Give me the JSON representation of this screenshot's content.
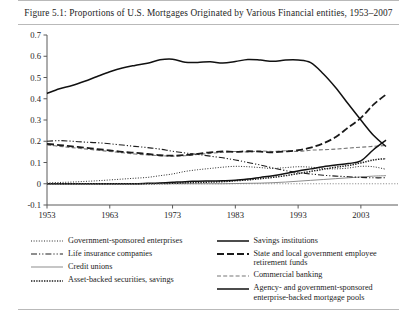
{
  "figure": {
    "caption": "Figure 5.1: Proportions of U.S. Mortgages Originated by Various Financial entities, 1953–2007"
  },
  "legend": {
    "left": [
      {
        "label": "Government-sponsored enterprises",
        "style": "dotted-fine"
      },
      {
        "label": "Life insurance companies",
        "style": "dash-dot-dot"
      },
      {
        "label": "Credit unions",
        "style": "solid-light"
      },
      {
        "label": "Asset-backed securities, savings",
        "style": "dotted-heavy"
      }
    ],
    "right": [
      {
        "label": "Savings institutions",
        "style": "solid-dark"
      },
      {
        "label": "State and local government employee retirement funds",
        "style": "dash-long"
      },
      {
        "label": "Commercial banking",
        "style": "dashed-light"
      },
      {
        "label": "Agency- and government-sponsored enterprise-backed mortgage pools",
        "style": "solid-dark"
      }
    ]
  },
  "chart_data": {
    "type": "line",
    "title": "Figure 5.1: Proportions of U.S. Mortgages Originated by Various Financial entities, 1953–2007",
    "xlabel": "",
    "ylabel": "",
    "xlim": [
      1953,
      2007
    ],
    "ylim": [
      -0.1,
      0.7
    ],
    "xticks": [
      1953,
      1963,
      1973,
      1983,
      1993,
      2003
    ],
    "yticks": [
      -0.1,
      0,
      0.1,
      0.2,
      0.3,
      0.4,
      0.5,
      0.6,
      0.7
    ],
    "ytick_labels": [
      "-0.1",
      "0",
      "0.1",
      "0.2",
      "0.3",
      "0.4",
      "0.5",
      "0.6",
      "0.7"
    ],
    "grid": false,
    "legend_position": "below",
    "x": [
      1953,
      1955,
      1957,
      1959,
      1961,
      1963,
      1965,
      1967,
      1969,
      1971,
      1973,
      1975,
      1977,
      1979,
      1981,
      1983,
      1985,
      1987,
      1989,
      1991,
      1993,
      1995,
      1997,
      1999,
      2001,
      2003,
      2005,
      2007
    ],
    "series": [
      {
        "name": "Savings institutions",
        "style": "solid-dark",
        "values": [
          0.425,
          0.447,
          0.462,
          0.482,
          0.505,
          0.527,
          0.545,
          0.557,
          0.567,
          0.583,
          0.586,
          0.572,
          0.571,
          0.574,
          0.568,
          0.575,
          0.585,
          0.582,
          0.576,
          0.582,
          0.582,
          0.57,
          0.518,
          0.452,
          0.375,
          0.3,
          0.228,
          0.175
        ]
      },
      {
        "name": "Agency- and government-sponsored enterprise-backed mortgage pools",
        "style": "solid-dark-rising",
        "values": [
          0.0,
          0.0,
          0.0,
          0.0,
          0.0,
          0.0,
          0.0,
          0.0,
          0.002,
          0.004,
          0.007,
          0.01,
          0.012,
          0.013,
          0.014,
          0.016,
          0.022,
          0.03,
          0.038,
          0.048,
          0.06,
          0.07,
          0.08,
          0.088,
          0.095,
          0.108,
          0.16,
          0.205
        ]
      },
      {
        "name": "State and local government employee retirement funds",
        "style": "dash-long",
        "values": [
          0.188,
          0.182,
          0.176,
          0.17,
          0.163,
          0.157,
          0.15,
          0.146,
          0.14,
          0.134,
          0.132,
          0.135,
          0.141,
          0.148,
          0.152,
          0.15,
          0.153,
          0.151,
          0.148,
          0.152,
          0.158,
          0.17,
          0.19,
          0.22,
          0.265,
          0.31,
          0.372,
          0.42
        ]
      },
      {
        "name": "Life insurance companies",
        "style": "dash-dot-dot",
        "values": [
          0.2,
          0.203,
          0.2,
          0.196,
          0.193,
          0.188,
          0.182,
          0.176,
          0.17,
          0.163,
          0.153,
          0.145,
          0.138,
          0.13,
          0.122,
          0.112,
          0.1,
          0.088,
          0.074,
          0.062,
          0.052,
          0.046,
          0.04,
          0.036,
          0.033,
          0.03,
          0.028,
          0.028
        ]
      },
      {
        "name": "Commercial banking",
        "style": "dashed-light",
        "values": [
          0.183,
          0.176,
          0.17,
          0.164,
          0.158,
          0.152,
          0.146,
          0.14,
          0.136,
          0.132,
          0.13,
          0.132,
          0.138,
          0.143,
          0.148,
          0.152,
          0.15,
          0.154,
          0.152,
          0.155,
          0.152,
          0.158,
          0.16,
          0.163,
          0.168,
          0.172,
          0.176,
          0.18
        ]
      },
      {
        "name": "Asset-backed securities, savings",
        "style": "dotted-heavy",
        "values": [
          0.0,
          0.0,
          0.0,
          0.0,
          0.0,
          0.0,
          0.0,
          0.0,
          0.0,
          0.001,
          0.002,
          0.004,
          0.006,
          0.008,
          0.01,
          0.014,
          0.018,
          0.024,
          0.03,
          0.038,
          0.048,
          0.058,
          0.068,
          0.078,
          0.086,
          0.098,
          0.112,
          0.118
        ]
      },
      {
        "name": "Government-sponsored enterprises",
        "style": "dotted-fine",
        "values": [
          0.004,
          0.006,
          0.008,
          0.011,
          0.014,
          0.018,
          0.022,
          0.026,
          0.03,
          0.038,
          0.046,
          0.058,
          0.066,
          0.072,
          0.078,
          0.082,
          0.08,
          0.076,
          0.072,
          0.076,
          0.08,
          0.078,
          0.072,
          0.07,
          0.074,
          0.082,
          0.08,
          0.068
        ]
      },
      {
        "name": "Credit unions",
        "style": "solid-light",
        "values": [
          0.0,
          0.0,
          0.0,
          0.0,
          0.0,
          0.0,
          0.0,
          0.0,
          0.0,
          0.0,
          0.0,
          0.0,
          0.0,
          0.0,
          0.0,
          0.001,
          0.002,
          0.003,
          0.005,
          0.008,
          0.012,
          0.016,
          0.02,
          0.024,
          0.028,
          0.032,
          0.036,
          0.038
        ]
      }
    ]
  }
}
